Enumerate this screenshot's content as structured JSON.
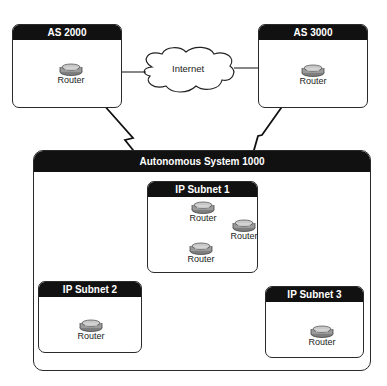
{
  "diagram": {
    "type": "network-topology",
    "clouds": [
      {
        "id": "internet",
        "label": "Internet"
      }
    ],
    "autonomous_systems": [
      {
        "id": "as2000",
        "label": "AS 2000",
        "routers": [
          {
            "label": "Router"
          }
        ]
      },
      {
        "id": "as3000",
        "label": "AS 3000",
        "routers": [
          {
            "label": "Router"
          }
        ]
      },
      {
        "id": "as1000",
        "label": "Autonomous System 1000",
        "subnets": [
          {
            "id": "subnet1",
            "label": "IP Subnet 1",
            "routers": [
              {
                "label": "Router"
              },
              {
                "label": "Router"
              },
              {
                "label": "Router"
              }
            ]
          },
          {
            "id": "subnet2",
            "label": "IP Subnet 2",
            "routers": [
              {
                "label": "Router"
              }
            ]
          },
          {
            "id": "subnet3",
            "label": "IP Subnet 3",
            "routers": [
              {
                "label": "Router"
              }
            ]
          }
        ]
      }
    ],
    "links": [
      {
        "from": "as2000.router",
        "to": "internet",
        "type": "serial"
      },
      {
        "from": "as3000.router",
        "to": "internet",
        "type": "serial"
      },
      {
        "from": "as2000.router",
        "to": "subnet1.router1",
        "type": "serial"
      },
      {
        "from": "as3000.router",
        "to": "subnet1.router1",
        "type": "serial"
      },
      {
        "from": "subnet1.router1",
        "to": "subnet1.router2",
        "type": "ethernet"
      },
      {
        "from": "subnet1.router2",
        "to": "subnet1.router3",
        "type": "ethernet"
      },
      {
        "from": "subnet1.router3",
        "to": "subnet2.router",
        "type": "ethernet"
      },
      {
        "from": "subnet1.router3",
        "to": "subnet3.router",
        "type": "ethernet"
      }
    ]
  },
  "colors": {
    "header_bg": "#111111",
    "header_text": "#ffffff",
    "border": "#2a2a2a",
    "router_body": "#9a9a9a"
  }
}
